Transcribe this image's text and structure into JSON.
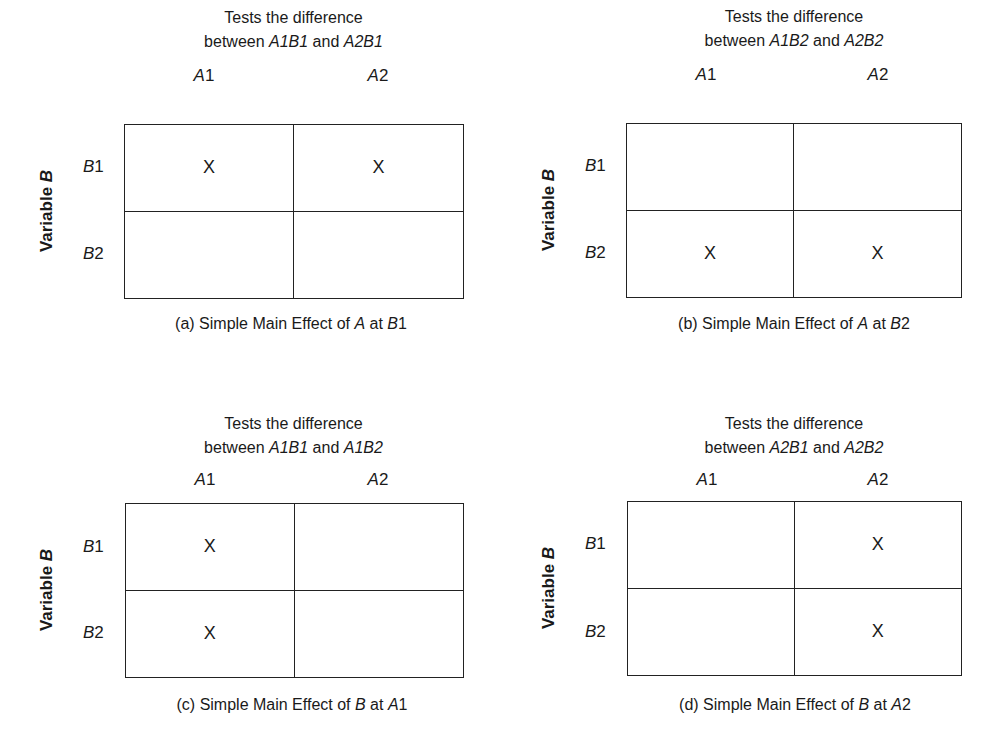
{
  "figure": {
    "row_variable_label": "Variable",
    "row_variable_symbol": "B",
    "column_levels": [
      {
        "letter": "A",
        "num": "1"
      },
      {
        "letter": "A",
        "num": "2"
      }
    ],
    "row_levels": [
      {
        "letter": "B",
        "num": "1"
      },
      {
        "letter": "B",
        "num": "2"
      }
    ],
    "mark": "X",
    "header_line1": "Tests the difference",
    "panels": [
      {
        "id": "a",
        "header_line2": {
          "pre": "between ",
          "c1": "A1B1",
          "mid": " and ",
          "c2": "A2B1"
        },
        "cells": [
          [
            "X",
            "X"
          ],
          [
            "",
            ""
          ]
        ],
        "caption": {
          "prefix": "(a) Simple Main Effect of ",
          "effect": "A",
          "mid": " at ",
          "level_letter": "B",
          "level_num": "1"
        }
      },
      {
        "id": "b",
        "header_line2": {
          "pre": "between ",
          "c1": "A1B2",
          "mid": " and ",
          "c2": "A2B2"
        },
        "cells": [
          [
            "",
            ""
          ],
          [
            "X",
            "X"
          ]
        ],
        "caption": {
          "prefix": "(b) Simple Main Effect of ",
          "effect": "A",
          "mid": " at ",
          "level_letter": "B",
          "level_num": "2"
        }
      },
      {
        "id": "c",
        "header_line2": {
          "pre": "between ",
          "c1": "A1B1",
          "mid": " and ",
          "c2": "A1B2"
        },
        "cells": [
          [
            "X",
            ""
          ],
          [
            "X",
            ""
          ]
        ],
        "caption": {
          "prefix": "(c) Simple Main Effect of ",
          "effect": "B",
          "mid": " at ",
          "level_letter": "A",
          "level_num": "1"
        }
      },
      {
        "id": "d",
        "header_line2": {
          "pre": "between ",
          "c1": "A2B1",
          "mid": " and ",
          "c2": "A2B2"
        },
        "cells": [
          [
            "",
            "X"
          ],
          [
            "",
            "X"
          ]
        ],
        "caption": {
          "prefix": "(d) Simple Main Effect of ",
          "effect": "B",
          "mid": " at ",
          "level_letter": "A",
          "level_num": "2"
        }
      }
    ]
  }
}
